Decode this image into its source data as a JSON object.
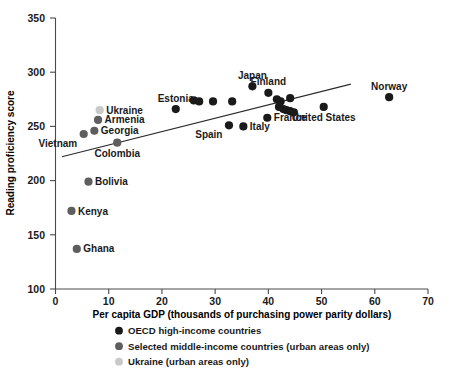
{
  "chart_data": {
    "type": "scatter",
    "title": "",
    "xlabel": "Per capita GDP (thousands of purchasing power parity dollars)",
    "ylabel": "Reading proficiency score",
    "xlim": [
      0,
      70
    ],
    "ylim": [
      100,
      350
    ],
    "xticks": [
      0,
      10,
      20,
      30,
      40,
      50,
      60,
      70
    ],
    "yticks": [
      100,
      150,
      200,
      250,
      300,
      350
    ],
    "grid": false,
    "legend_position": "below-axis-centered",
    "colors": {
      "oecd": "#1a1a1a",
      "middle_income": "#5e5e5e",
      "ukraine": "#c9c9c9",
      "axis": "#4a4a4a",
      "trend": "#2b2b2b",
      "background": "#ffffff"
    },
    "series": [
      {
        "name": "OECD high-income countries",
        "marker_color": "#1a1a1a",
        "points": [
          {
            "label": "Estonia",
            "x": 22.6,
            "y": 266,
            "label_pos": "above"
          },
          {
            "label": "",
            "x": 26.0,
            "y": 274,
            "label_pos": "none"
          },
          {
            "label": "",
            "x": 27.0,
            "y": 273,
            "label_pos": "none"
          },
          {
            "label": "",
            "x": 29.6,
            "y": 273,
            "label_pos": "none"
          },
          {
            "label": "Spain",
            "x": 32.6,
            "y": 251,
            "label_pos": "below-left"
          },
          {
            "label": "",
            "x": 33.2,
            "y": 273,
            "label_pos": "none"
          },
          {
            "label": "Italy",
            "x": 35.3,
            "y": 250,
            "label_pos": "right"
          },
          {
            "label": "Japan",
            "x": 37.0,
            "y": 287,
            "label_pos": "above"
          },
          {
            "label": "Finland",
            "x": 40.0,
            "y": 281,
            "label_pos": "above"
          },
          {
            "label": "France",
            "x": 39.8,
            "y": 258,
            "label_pos": "right"
          },
          {
            "label": "",
            "x": 41.6,
            "y": 275,
            "label_pos": "none"
          },
          {
            "label": "",
            "x": 42.3,
            "y": 273,
            "label_pos": "none"
          },
          {
            "label": "",
            "x": 42.0,
            "y": 268,
            "label_pos": "none"
          },
          {
            "label": "",
            "x": 42.8,
            "y": 266,
            "label_pos": "none"
          },
          {
            "label": "",
            "x": 43.4,
            "y": 265,
            "label_pos": "none"
          },
          {
            "label": "",
            "x": 44.1,
            "y": 264,
            "label_pos": "none"
          },
          {
            "label": "",
            "x": 44.8,
            "y": 263,
            "label_pos": "none"
          },
          {
            "label": "",
            "x": 44.1,
            "y": 276,
            "label_pos": "none"
          },
          {
            "label": "United States",
            "x": 50.4,
            "y": 268,
            "label_pos": "below"
          },
          {
            "label": "Norway",
            "x": 62.7,
            "y": 277,
            "label_pos": "above"
          }
        ]
      },
      {
        "name": "Selected middle-income countries (urban areas only)",
        "marker_color": "#5e5e5e",
        "points": [
          {
            "label": "Ghana",
            "x": 4.0,
            "y": 137,
            "label_pos": "right"
          },
          {
            "label": "Kenya",
            "x": 3.0,
            "y": 172,
            "label_pos": "right"
          },
          {
            "label": "Bolivia",
            "x": 6.2,
            "y": 199,
            "label_pos": "right"
          },
          {
            "label": "Vietnam",
            "x": 5.3,
            "y": 243,
            "label_pos": "below-left"
          },
          {
            "label": "Georgia",
            "x": 7.3,
            "y": 246,
            "label_pos": "right"
          },
          {
            "label": "Armenia",
            "x": 8.0,
            "y": 256,
            "label_pos": "right"
          },
          {
            "label": "Colombia",
            "x": 11.6,
            "y": 235,
            "label_pos": "below"
          }
        ]
      },
      {
        "name": "Ukraine (urban areas only)",
        "marker_color": "#c9c9c9",
        "points": [
          {
            "label": "Ukraine",
            "x": 8.3,
            "y": 265,
            "label_pos": "right"
          }
        ]
      }
    ],
    "trendline": {
      "x0": 1.2,
      "y0": 222,
      "x1": 55.5,
      "y1": 289
    }
  },
  "legend": {
    "items": [
      {
        "label": "OECD high-income countries",
        "color": "#1a1a1a"
      },
      {
        "label": "Selected middle-income countries (urban areas only)",
        "color": "#5e5e5e"
      },
      {
        "label": "Ukraine (urban areas only)",
        "color": "#c9c9c9"
      }
    ]
  }
}
